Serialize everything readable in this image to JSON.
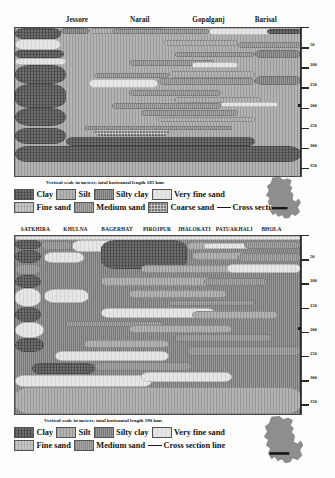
{
  "panels": [
    {
      "id": "top",
      "sites": [
        "Jessore",
        "Narail",
        "Gopalganj",
        "Barisal"
      ],
      "site_x_pct": [
        22,
        44,
        68,
        88
      ],
      "caption": "Vertical scale in meters, total horizontal length 185 kms",
      "axis": {
        "ticks": [
          "50",
          "100",
          "150",
          "200",
          "250",
          "300",
          "350"
        ],
        "unit": "meters",
        "min": 0,
        "max": 370
      },
      "legend_rows": [
        [
          {
            "label": "Clay",
            "lith": "clay"
          },
          {
            "label": "Silt",
            "lith": "silt"
          },
          {
            "label": "Silty clay",
            "lith": "siltyclay"
          },
          {
            "label": "Very fine sand",
            "lith": "vfsand"
          }
        ],
        [
          {
            "label": "Fine sand",
            "lith": "fsand"
          },
          {
            "label": "Medium sand",
            "lith": "msand"
          },
          {
            "label": "Coarse sand",
            "lith": "csand"
          },
          {
            "label": "Cross section",
            "lith": "line"
          }
        ]
      ]
    },
    {
      "id": "bottom",
      "sites": [
        "SATKHIRA",
        "KHULNA",
        "BAGERHAT",
        "PIROJPUR",
        "JHALOKATI",
        "PATUAKHALI",
        "BHOLA"
      ],
      "site_x_pct": [
        7.5,
        21.5,
        36,
        50,
        63,
        77,
        90
      ],
      "caption": "Vertical scale in meters, total horizontal length 190 kms",
      "axis": {
        "ticks": [
          "50",
          "100",
          "150",
          "200",
          "250",
          "300",
          "350"
        ],
        "unit": "meters",
        "min": 0,
        "max": 370
      },
      "legend_rows": [
        [
          {
            "label": "Clay",
            "lith": "clay"
          },
          {
            "label": "Silt",
            "lith": "silt"
          },
          {
            "label": "Silty clay",
            "lith": "siltyclay"
          },
          {
            "label": "Very fine sand",
            "lith": "vfsand"
          }
        ],
        [
          {
            "label": "Fine sand",
            "lith": "fsand"
          },
          {
            "label": "Medium sand",
            "lith": "msand"
          },
          {
            "label": "Cross section line",
            "lith": "line"
          }
        ]
      ]
    }
  ],
  "chart_data": {
    "type": "area",
    "ylabel": "Depth below surface (m)",
    "ylim": [
      0,
      370
    ],
    "grid": false,
    "legend_position": "below-plot",
    "sections": [
      {
        "name": "Jessore - Narail - Gopalganj - Barisal",
        "horizontal_length_km": 185,
        "sites": [
          "Jessore",
          "Narail",
          "Gopalganj",
          "Barisal"
        ],
        "background_lithology": "silt",
        "units": [
          {
            "lith": "clay",
            "x_pct": 0,
            "y_m": 0,
            "w_pct": 16,
            "h_m": 28
          },
          {
            "lith": "siltyclay",
            "x_pct": 16,
            "y_m": 0,
            "w_pct": 10,
            "h_m": 16
          },
          {
            "lith": "silt",
            "x_pct": 26,
            "y_m": 0,
            "w_pct": 26,
            "h_m": 14
          },
          {
            "lith": "msand",
            "x_pct": 34,
            "y_m": 3,
            "w_pct": 34,
            "h_m": 13
          },
          {
            "lith": "vfsand",
            "x_pct": 68,
            "y_m": 0,
            "w_pct": 22,
            "h_m": 17
          },
          {
            "lith": "clay",
            "x_pct": 88,
            "y_m": 2,
            "w_pct": 12,
            "h_m": 14
          },
          {
            "lith": "vfsand",
            "x_pct": 0,
            "y_m": 28,
            "w_pct": 16,
            "h_m": 26
          },
          {
            "lith": "silt",
            "x_pct": 52,
            "y_m": 30,
            "w_pct": 26,
            "h_m": 14
          },
          {
            "lith": "msand",
            "x_pct": 78,
            "y_m": 34,
            "w_pct": 22,
            "h_m": 16
          },
          {
            "lith": "clay",
            "x_pct": 0,
            "y_m": 54,
            "w_pct": 17,
            "h_m": 22
          },
          {
            "lith": "msand",
            "x_pct": 56,
            "y_m": 60,
            "w_pct": 28,
            "h_m": 13
          },
          {
            "lith": "siltyclay",
            "x_pct": 84,
            "y_m": 56,
            "w_pct": 16,
            "h_m": 18
          },
          {
            "lith": "vfsand",
            "x_pct": 0,
            "y_m": 76,
            "w_pct": 18,
            "h_m": 16
          },
          {
            "lith": "msand",
            "x_pct": 40,
            "y_m": 80,
            "w_pct": 30,
            "h_m": 14
          },
          {
            "lith": "vfsand",
            "x_pct": 62,
            "y_m": 84,
            "w_pct": 16,
            "h_m": 16
          },
          {
            "lith": "clay",
            "x_pct": 0,
            "y_m": 92,
            "w_pct": 18,
            "h_m": 48
          },
          {
            "lith": "msand",
            "x_pct": 28,
            "y_m": 112,
            "w_pct": 26,
            "h_m": 14
          },
          {
            "lith": "silt",
            "x_pct": 54,
            "y_m": 108,
            "w_pct": 30,
            "h_m": 16
          },
          {
            "lith": "vfsand",
            "x_pct": 26,
            "y_m": 128,
            "w_pct": 24,
            "h_m": 22
          },
          {
            "lith": "msand",
            "x_pct": 50,
            "y_m": 126,
            "w_pct": 34,
            "h_m": 16
          },
          {
            "lith": "siltyclay",
            "x_pct": 84,
            "y_m": 120,
            "w_pct": 16,
            "h_m": 22
          },
          {
            "lith": "clay",
            "x_pct": 0,
            "y_m": 140,
            "w_pct": 18,
            "h_m": 60
          },
          {
            "lith": "msand",
            "x_pct": 40,
            "y_m": 156,
            "w_pct": 32,
            "h_m": 14
          },
          {
            "lith": "silt",
            "x_pct": 56,
            "y_m": 172,
            "w_pct": 30,
            "h_m": 16
          },
          {
            "lith": "msand",
            "x_pct": 34,
            "y_m": 188,
            "w_pct": 38,
            "h_m": 14
          },
          {
            "lith": "vfsand",
            "x_pct": 72,
            "y_m": 184,
            "w_pct": 20,
            "h_m": 14
          },
          {
            "lith": "msand",
            "x_pct": 44,
            "y_m": 206,
            "w_pct": 34,
            "h_m": 13
          },
          {
            "lith": "clay",
            "x_pct": 0,
            "y_m": 200,
            "w_pct": 18,
            "h_m": 44
          },
          {
            "lith": "silt",
            "x_pct": 50,
            "y_m": 222,
            "w_pct": 34,
            "h_m": 14
          },
          {
            "lith": "csand",
            "x_pct": 28,
            "y_m": 250,
            "w_pct": 26,
            "h_m": 20
          },
          {
            "lith": "msand",
            "x_pct": 24,
            "y_m": 244,
            "w_pct": 52,
            "h_m": 12
          },
          {
            "lith": "clay",
            "x_pct": 0,
            "y_m": 250,
            "w_pct": 18,
            "h_m": 40
          },
          {
            "lith": "clay",
            "x_pct": 18,
            "y_m": 272,
            "w_pct": 66,
            "h_m": 24
          },
          {
            "lith": "clay",
            "x_pct": 0,
            "y_m": 296,
            "w_pct": 100,
            "h_m": 40
          }
        ]
      },
      {
        "name": "Satkhira - Khulna - Bagerhat - Pirojpur - Jhalokati - Patuakhali - Bhola",
        "horizontal_length_km": 190,
        "sites": [
          "SATKHIRA",
          "KHULNA",
          "BAGERHAT",
          "PIROJPUR",
          "JHALOKATI",
          "PATUAKHALI",
          "BHOLA"
        ],
        "background_lithology": "siltyclay",
        "units": [
          {
            "lith": "vfsand",
            "x_pct": 0,
            "y_m": 0,
            "w_pct": 100,
            "h_m": 8
          },
          {
            "lith": "clay",
            "x_pct": 0,
            "y_m": 8,
            "w_pct": 9,
            "h_m": 18
          },
          {
            "lith": "msand",
            "x_pct": 9,
            "y_m": 10,
            "w_pct": 11,
            "h_m": 20
          },
          {
            "lith": "vfsand",
            "x_pct": 20,
            "y_m": 8,
            "w_pct": 18,
            "h_m": 26
          },
          {
            "lith": "clay",
            "x_pct": 30,
            "y_m": 8,
            "w_pct": 30,
            "h_m": 60
          },
          {
            "lith": "silt",
            "x_pct": 60,
            "y_m": 12,
            "w_pct": 14,
            "h_m": 18
          },
          {
            "lith": "vfsand",
            "x_pct": 66,
            "y_m": 14,
            "w_pct": 20,
            "h_m": 14
          },
          {
            "lith": "msand",
            "x_pct": 80,
            "y_m": 10,
            "w_pct": 20,
            "h_m": 18
          },
          {
            "lith": "clay",
            "x_pct": 0,
            "y_m": 30,
            "w_pct": 9,
            "h_m": 26
          },
          {
            "lith": "vfsand",
            "x_pct": 10,
            "y_m": 34,
            "w_pct": 14,
            "h_m": 22
          },
          {
            "lith": "silt",
            "x_pct": 62,
            "y_m": 34,
            "w_pct": 24,
            "h_m": 16
          },
          {
            "lith": "msand",
            "x_pct": 78,
            "y_m": 36,
            "w_pct": 22,
            "h_m": 18
          },
          {
            "lith": "msand",
            "x_pct": 0,
            "y_m": 58,
            "w_pct": 9,
            "h_m": 24
          },
          {
            "lith": "silt",
            "x_pct": 44,
            "y_m": 60,
            "w_pct": 36,
            "h_m": 16
          },
          {
            "lith": "vfsand",
            "x_pct": 74,
            "y_m": 58,
            "w_pct": 26,
            "h_m": 18
          },
          {
            "lith": "clay",
            "x_pct": 0,
            "y_m": 82,
            "w_pct": 9,
            "h_m": 26
          },
          {
            "lith": "silt",
            "x_pct": 30,
            "y_m": 86,
            "w_pct": 40,
            "h_m": 18
          },
          {
            "lith": "msand",
            "x_pct": 66,
            "y_m": 88,
            "w_pct": 22,
            "h_m": 16
          },
          {
            "lith": "vfsand",
            "x_pct": 0,
            "y_m": 108,
            "w_pct": 9,
            "h_m": 40
          },
          {
            "lith": "silt",
            "x_pct": 40,
            "y_m": 112,
            "w_pct": 34,
            "h_m": 16
          },
          {
            "lith": "vfsand",
            "x_pct": 10,
            "y_m": 110,
            "w_pct": 16,
            "h_m": 30
          },
          {
            "lith": "msand",
            "x_pct": 54,
            "y_m": 132,
            "w_pct": 30,
            "h_m": 14
          },
          {
            "lith": "clay",
            "x_pct": 0,
            "y_m": 148,
            "w_pct": 9,
            "h_m": 30
          },
          {
            "lith": "vfsand",
            "x_pct": 30,
            "y_m": 150,
            "w_pct": 40,
            "h_m": 20
          },
          {
            "lith": "silt",
            "x_pct": 62,
            "y_m": 156,
            "w_pct": 30,
            "h_m": 16
          },
          {
            "lith": "msand",
            "x_pct": 18,
            "y_m": 176,
            "w_pct": 34,
            "h_m": 14
          },
          {
            "lith": "silt",
            "x_pct": 40,
            "y_m": 186,
            "w_pct": 36,
            "h_m": 16
          },
          {
            "lith": "vfsand",
            "x_pct": 0,
            "y_m": 178,
            "w_pct": 10,
            "h_m": 34
          },
          {
            "lith": "msand",
            "x_pct": 56,
            "y_m": 204,
            "w_pct": 34,
            "h_m": 16
          },
          {
            "lith": "clay",
            "x_pct": 0,
            "y_m": 212,
            "w_pct": 10,
            "h_m": 30
          },
          {
            "lith": "silt",
            "x_pct": 24,
            "y_m": 216,
            "w_pct": 30,
            "h_m": 16
          },
          {
            "lith": "msand",
            "x_pct": 60,
            "y_m": 228,
            "w_pct": 40,
            "h_m": 22
          },
          {
            "lith": "vfsand",
            "x_pct": 14,
            "y_m": 240,
            "w_pct": 40,
            "h_m": 20
          },
          {
            "lith": "clay",
            "x_pct": 6,
            "y_m": 264,
            "w_pct": 22,
            "h_m": 22
          },
          {
            "lith": "msand",
            "x_pct": 28,
            "y_m": 262,
            "w_pct": 34,
            "h_m": 18
          },
          {
            "lith": "vfsand",
            "x_pct": 0,
            "y_m": 288,
            "w_pct": 48,
            "h_m": 26
          },
          {
            "lith": "vfsand",
            "x_pct": 44,
            "y_m": 282,
            "w_pct": 32,
            "h_m": 22
          },
          {
            "lith": "silt",
            "x_pct": 0,
            "y_m": 314,
            "w_pct": 100,
            "h_m": 56
          }
        ]
      }
    ]
  }
}
